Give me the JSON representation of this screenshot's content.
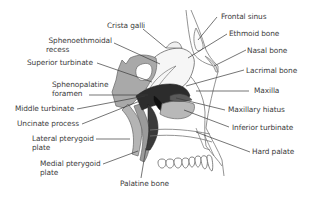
{
  "diagram": {
    "colors": {
      "light_bone": "#f4f4f4",
      "mid_grey": "#a9a9a9",
      "dark_grey": "#555555",
      "black": "#1a1a1a",
      "outline": "#555555",
      "leader_line": "#3a3a3a",
      "text": "#3c3c3c"
    },
    "labels_left": [
      {
        "id": "sphenoethmoidal-recess",
        "line1": "Sphenoethmoidal",
        "line2": "recess"
      },
      {
        "id": "superior-turbinate",
        "line1": "Superior turbinate"
      },
      {
        "id": "sphenopalatine-foramen",
        "line1": "Sphenopalatine",
        "line2": "foramen"
      },
      {
        "id": "middle-turbinate",
        "line1": "Middle turbinate"
      },
      {
        "id": "uncinate-process",
        "line1": "Uncinate process"
      },
      {
        "id": "lateral-pterygoid-plate",
        "line1": "Lateral pterygoid",
        "line2": "plate"
      },
      {
        "id": "medial-pterygoid-plate",
        "line1": "Medial pterygoid",
        "line2": "plate"
      }
    ],
    "labels_top": [
      {
        "id": "crista-galli",
        "line1": "Crista galli"
      }
    ],
    "labels_right": [
      {
        "id": "frontal-sinus",
        "line1": "Frontal sinus"
      },
      {
        "id": "ethmoid-bone",
        "line1": "Ethmoid bone"
      },
      {
        "id": "nasal-bone",
        "line1": "Nasal bone"
      },
      {
        "id": "lacrimal-bone",
        "line1": "Lacrimal bone"
      },
      {
        "id": "maxilla",
        "line1": "Maxilla"
      },
      {
        "id": "maxillary-hiatus",
        "line1": "Maxillary hiatus"
      },
      {
        "id": "inferior-turbinate",
        "line1": "Inferior turbinate"
      },
      {
        "id": "hard-palate",
        "line1": "Hard palate"
      }
    ],
    "labels_bottom": [
      {
        "id": "palatine-bone",
        "line1": "Palatine bone"
      }
    ]
  }
}
